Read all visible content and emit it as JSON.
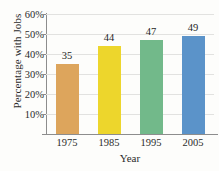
{
  "chart_data": {
    "type": "bar",
    "title": "",
    "xlabel": "Year",
    "ylabel": "Percentage with Jobs",
    "categories": [
      "1975",
      "1985",
      "1995",
      "2005"
    ],
    "values": [
      35,
      44,
      47,
      49
    ],
    "value_labels": [
      "35",
      "44",
      "47",
      "49"
    ],
    "ylim": [
      0,
      60
    ],
    "ytick_values": [
      10,
      20,
      30,
      40,
      50,
      60
    ],
    "ytick_labels": [
      "10%",
      "20%",
      "30%",
      "40%",
      "50%",
      "60%"
    ],
    "grid": true,
    "legend": "none",
    "bar_colors": [
      "#dda55c",
      "#edd62c",
      "#72b98a",
      "#5b93c9"
    ],
    "axis_color": "#8d8d8d",
    "grid_color": "#e2e2e0",
    "background": "#fdfdfb"
  }
}
